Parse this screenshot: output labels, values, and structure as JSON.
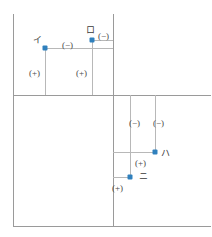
{
  "diagram": {
    "colors": {
      "node": "#2f80bd",
      "axis": "#9a9a9a",
      "lead": "#b8b8b8",
      "text": "#4a4a4a",
      "background": "#ffffff"
    },
    "stations": [
      {
        "id": "i",
        "label": "イ",
        "x": 45,
        "y": 48
      },
      {
        "id": "ro",
        "label": "ロ",
        "x": 92,
        "y": 40
      },
      {
        "id": "ha",
        "label": "ハ",
        "x": 155,
        "y": 152
      },
      {
        "id": "ni",
        "label": "ニ",
        "x": 130,
        "y": 177
      }
    ],
    "signs": [
      {
        "id": "sign-ro-minus",
        "label": "(−)",
        "x": 98,
        "y": 31
      },
      {
        "id": "sign-i-minus",
        "label": "(−)",
        "x": 62,
        "y": 40
      },
      {
        "id": "sign-i-plus",
        "label": "(+)",
        "x": 29,
        "y": 68
      },
      {
        "id": "sign-ro-plus",
        "label": "(+)",
        "x": 76,
        "y": 68
      },
      {
        "id": "sign-ha-minus1",
        "label": "(−)",
        "x": 129,
        "y": 118
      },
      {
        "id": "sign-ha-minus2",
        "label": "(−)",
        "x": 153,
        "y": 118
      },
      {
        "id": "sign-ha-plus",
        "label": "(+)",
        "x": 135,
        "y": 158
      },
      {
        "id": "sign-ni-plus",
        "label": "(+)",
        "x": 112,
        "y": 183
      }
    ],
    "axes": [
      {
        "id": "axis-left-vertical",
        "orient": "v",
        "x": 13,
        "y": 14,
        "len": 213
      },
      {
        "id": "axis-center-vertical",
        "orient": "v",
        "x": 113,
        "y": 14,
        "len": 213
      },
      {
        "id": "axis-upper-horizontal",
        "orient": "h",
        "x": 13,
        "y": 95,
        "len": 198
      },
      {
        "id": "axis-bottom-horizontal",
        "orient": "h",
        "x": 13,
        "y": 226,
        "len": 198
      }
    ],
    "leads": [
      {
        "id": "lead-i-vertical",
        "orient": "v",
        "x": 45,
        "y": 48,
        "len": 47
      },
      {
        "id": "lead-ro-vertical",
        "orient": "v",
        "x": 92,
        "y": 40,
        "len": 55
      },
      {
        "id": "lead-i-horizontal",
        "orient": "h",
        "x": 45,
        "y": 48,
        "len": 68
      },
      {
        "id": "lead-ro-horizontal",
        "orient": "h",
        "x": 92,
        "y": 40,
        "len": 21
      },
      {
        "id": "lead-ha-vertical",
        "orient": "v",
        "x": 155,
        "y": 95,
        "len": 57
      },
      {
        "id": "lead-ni-vertical",
        "orient": "v",
        "x": 130,
        "y": 95,
        "len": 82
      },
      {
        "id": "lead-ha-horizontal",
        "orient": "h",
        "x": 113,
        "y": 152,
        "len": 42
      },
      {
        "id": "lead-ni-horizontal",
        "orient": "h",
        "x": 113,
        "y": 177,
        "len": 17
      }
    ]
  }
}
